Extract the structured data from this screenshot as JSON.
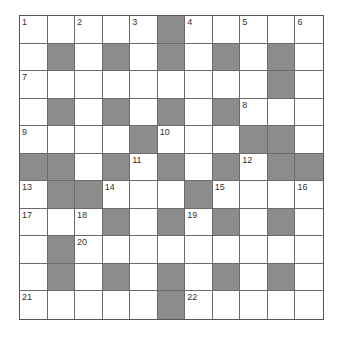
{
  "puzzle": {
    "rows": 11,
    "cols": 11,
    "colors": {
      "block": "#8c8c8c",
      "cell": "#ffffff",
      "line": "#6a6a6a",
      "number": "#333333"
    },
    "grid": [
      [
        "1",
        ".",
        "2",
        ".",
        "3",
        "#",
        "4",
        ".",
        "5",
        ".",
        "6"
      ],
      [
        ".",
        "#",
        ".",
        "#",
        ".",
        "#",
        ".",
        "#",
        ".",
        "#",
        "."
      ],
      [
        "7",
        ".",
        ".",
        ".",
        ".",
        ".",
        ".",
        ".",
        ".",
        "#",
        "."
      ],
      [
        ".",
        "#",
        ".",
        "#",
        ".",
        "#",
        ".",
        "#",
        "8",
        ".",
        "."
      ],
      [
        "9",
        ".",
        ".",
        ".",
        "#",
        "10",
        ".",
        ".",
        "#",
        "#",
        "."
      ],
      [
        "#",
        "#",
        ".",
        "#",
        "11",
        "#",
        ".",
        "#",
        "12",
        "#",
        "#"
      ],
      [
        "13",
        "#",
        "#",
        "14",
        ".",
        ".",
        "#",
        "15",
        ".",
        ".",
        "16"
      ],
      [
        "17",
        ".",
        "18",
        "#",
        ".",
        "#",
        "19",
        "#",
        ".",
        "#",
        "."
      ],
      [
        ".",
        "#",
        "20",
        ".",
        ".",
        ".",
        ".",
        ".",
        ".",
        ".",
        "."
      ],
      [
        ".",
        "#",
        ".",
        "#",
        ".",
        "#",
        ".",
        "#",
        ".",
        "#",
        "."
      ],
      [
        "21",
        ".",
        ".",
        ".",
        ".",
        "#",
        "22",
        ".",
        ".",
        ".",
        "."
      ]
    ],
    "clue_numbers": [
      "1",
      "2",
      "3",
      "4",
      "5",
      "6",
      "7",
      "8",
      "9",
      "10",
      "11",
      "12",
      "13",
      "14",
      "15",
      "16",
      "17",
      "18",
      "19",
      "20",
      "21",
      "22"
    ]
  }
}
